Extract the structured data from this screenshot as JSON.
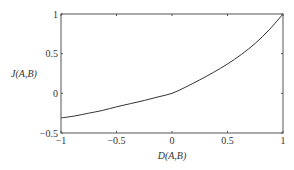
{
  "chart_data": {
    "type": "line",
    "title": "",
    "xlabel": "D(A,B)",
    "ylabel": "J(A,B)",
    "xlim": [
      -1,
      1
    ],
    "ylim": [
      -0.5,
      1
    ],
    "xticks": [
      -1,
      -0.5,
      0,
      0.5,
      1
    ],
    "xtick_labels": [
      "−1",
      "−0.5",
      "0",
      "0.5",
      "1"
    ],
    "yticks": [
      -0.5,
      0,
      0.5,
      1
    ],
    "ytick_labels": [
      "−0.5",
      "0",
      "0.5",
      "1"
    ],
    "grid": false,
    "legend": null,
    "series": [
      {
        "name": "J(A,B)",
        "color": "#333333",
        "x": [
          -1,
          -0.875,
          -0.75,
          -0.625,
          -0.5,
          -0.375,
          -0.25,
          -0.125,
          0,
          0.125,
          0.25,
          0.375,
          0.5,
          0.625,
          0.75,
          0.875,
          1
        ],
        "y": [
          -0.31,
          -0.285,
          -0.25,
          -0.215,
          -0.17,
          -0.13,
          -0.09,
          -0.045,
          0,
          0.08,
          0.17,
          0.265,
          0.37,
          0.49,
          0.63,
          0.8,
          1
        ]
      }
    ]
  }
}
